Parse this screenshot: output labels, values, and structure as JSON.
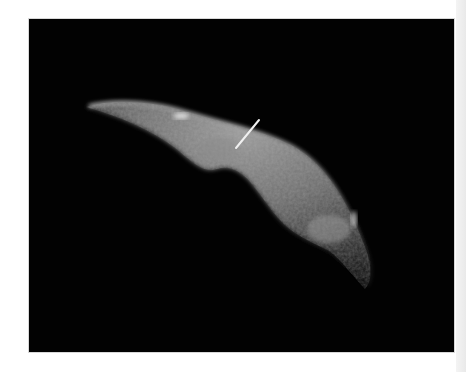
{
  "figure": {
    "annotation": "white arrow pointing to surface feature",
    "colors": {
      "background": "#020202",
      "surface_light": "#b8b8b8",
      "surface_mid": "#6e6e6e",
      "surface_dark": "#2a2a2a",
      "arrow": "#f0f0f0",
      "page": "#ffffff"
    }
  }
}
